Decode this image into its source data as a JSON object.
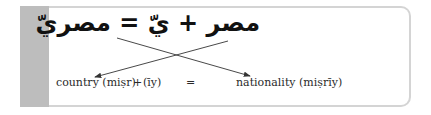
{
  "arabic_equation": "مصر + يّ = مصريّ",
  "labels": {
    "country": "country (miṣr)",
    "plus": "+",
    "suffix": "(īy)",
    "equals": "=",
    "nationality": "nationality (miṣrīy)"
  },
  "colors": {
    "side_bar": "#bdbdbd",
    "border": "#d4d4d4",
    "arrow": "#333333"
  }
}
